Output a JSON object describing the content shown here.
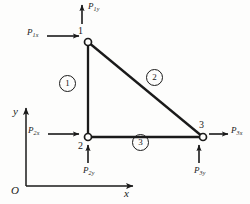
{
  "figure": {
    "background_color": "#fdfdfc",
    "ink_color": "#1a1a1a"
  },
  "axes": {
    "x_label": "x",
    "y_label": "y",
    "origin_label": "O"
  },
  "nodes": [
    {
      "id": "1",
      "label": "1",
      "x": 88,
      "y": 42
    },
    {
      "id": "2",
      "label": "2",
      "x": 88,
      "y": 137
    },
    {
      "id": "3",
      "label": "3",
      "x": 203,
      "y": 137
    }
  ],
  "elements": [
    {
      "id": "1",
      "label": "1",
      "from": "1",
      "to": "2",
      "marker_x": 66,
      "marker_y": 82
    },
    {
      "id": "2",
      "label": "2",
      "from": "1",
      "to": "3",
      "marker_x": 153,
      "marker_y": 76
    },
    {
      "id": "3",
      "label": "3",
      "from": "2",
      "to": "3",
      "marker_x": 139,
      "marker_y": 141
    }
  ],
  "forces": [
    {
      "name": "P",
      "sub": "1x",
      "node": "1",
      "direction": "right"
    },
    {
      "name": "P",
      "sub": "1y",
      "node": "1",
      "direction": "up"
    },
    {
      "name": "P",
      "sub": "2x",
      "node": "2",
      "direction": "right"
    },
    {
      "name": "P",
      "sub": "2y",
      "node": "2",
      "direction": "up"
    },
    {
      "name": "P",
      "sub": "3x",
      "node": "3",
      "direction": "right"
    },
    {
      "name": "P",
      "sub": "3y",
      "node": "3",
      "direction": "up"
    }
  ]
}
